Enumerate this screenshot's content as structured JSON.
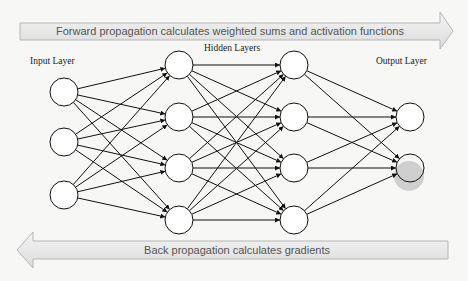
{
  "forward_arrow": {
    "label": "Forward propagation calculates weighted sums and activation functions",
    "direction": "right",
    "fill": "#e8e8e8",
    "stroke": "#b0b0b0"
  },
  "back_arrow": {
    "label": "Back propagation calculates gradients",
    "direction": "left",
    "fill": "#e8e8e8",
    "stroke": "#b0b0b0"
  },
  "labels": {
    "input": "Input Layer",
    "hidden": "Hidden Layers",
    "output": "Output Layer"
  },
  "layers": [
    {
      "name": "input",
      "x": 64,
      "nodes": [
        92,
        142,
        195
      ]
    },
    {
      "name": "hidden-1",
      "x": 179,
      "nodes": [
        65,
        117,
        168,
        220
      ]
    },
    {
      "name": "hidden-2",
      "x": 294,
      "nodes": [
        65,
        117,
        168,
        220
      ]
    },
    {
      "name": "output",
      "x": 410,
      "nodes": [
        117,
        168
      ]
    }
  ],
  "node_radius": 14,
  "highlight": {
    "x": 409,
    "y": 176,
    "r": 15,
    "color": "#c8c8c8"
  },
  "colors": {
    "line": "#111111",
    "node_fill": "#ffffff"
  }
}
